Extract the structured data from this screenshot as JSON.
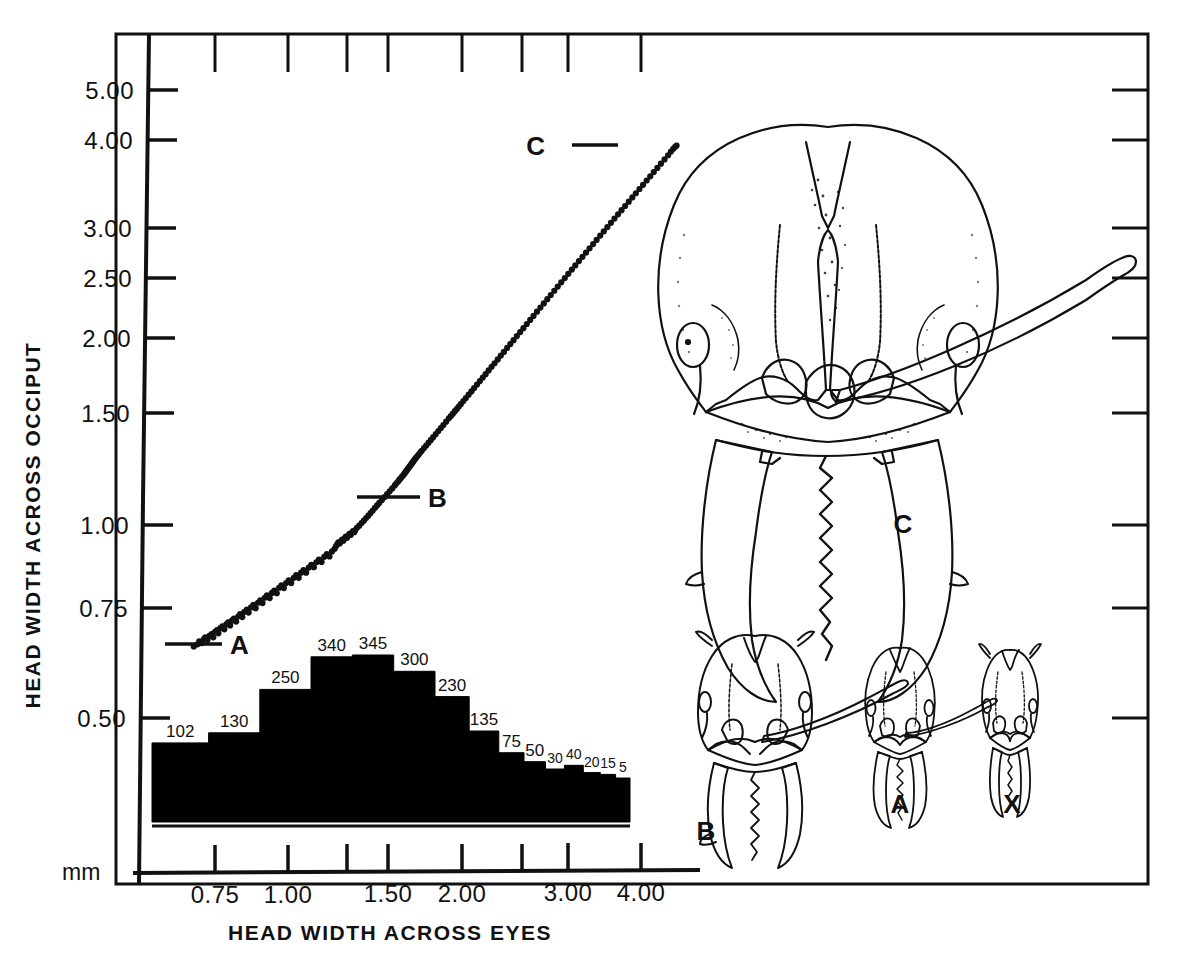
{
  "figure": {
    "title": "",
    "background_color": "#ffffff",
    "ink_color": "#000000"
  },
  "axes": {
    "y_label": "HEAD WIDTH ACROSS OCCIPUT",
    "x_label": "HEAD WIDTH ACROSS EYES",
    "unit_label": "mm",
    "y_ticks": [
      "5.00",
      "4.00",
      "3.00",
      "2.50",
      "2.00",
      "1.50",
      "1.00",
      "0.75",
      "0.50"
    ],
    "x_ticks": [
      "0.75",
      "1.00",
      "1.50",
      "2.00",
      "3.00",
      "4.00"
    ]
  },
  "chart_data": {
    "type": "scatter",
    "title": "",
    "xlabel": "HEAD WIDTH ACROSS EYES",
    "ylabel": "HEAD WIDTH ACROSS OCCIPUT",
    "units": "mm",
    "x_scale": "log",
    "y_scale": "log",
    "xlim": [
      0.6,
      4.6
    ],
    "ylim": [
      0.42,
      5.6
    ],
    "grid": false,
    "legend": "none",
    "x_tick_values": [
      0.75,
      1.0,
      1.25,
      1.5,
      2.0,
      2.5,
      3.0,
      4.0
    ],
    "x_tick_labels": [
      "0.75",
      "1.00",
      "",
      "1.50",
      "2.00",
      "",
      "3.00",
      "4.00"
    ],
    "y_tick_values": [
      5.0,
      4.0,
      3.0,
      2.5,
      2.0,
      1.5,
      1.0,
      0.75,
      0.5
    ],
    "y_tick_labels": [
      "5.00",
      "4.00",
      "3.00",
      "2.50",
      "2.00",
      "1.50",
      "1.00",
      "0.75",
      "0.50"
    ],
    "annotations": [
      {
        "label": "A",
        "x": 0.8,
        "y": 0.68,
        "note": "smallest minor worker caste"
      },
      {
        "label": "B",
        "x": 1.42,
        "y": 1.1,
        "note": "media worker caste"
      },
      {
        "label": "C",
        "x": 3.55,
        "y": 4.05,
        "note": "largest major worker caste"
      }
    ],
    "series": [
      {
        "name": "workers",
        "marker": "filled-circle",
        "points": [
          [
            0.69,
            0.65
          ],
          [
            0.7,
            0.655
          ],
          [
            0.705,
            0.662
          ],
          [
            0.712,
            0.658
          ],
          [
            0.718,
            0.668
          ],
          [
            0.722,
            0.672
          ],
          [
            0.728,
            0.666
          ],
          [
            0.734,
            0.676
          ],
          [
            0.74,
            0.68
          ],
          [
            0.745,
            0.672
          ],
          [
            0.75,
            0.686
          ],
          [
            0.756,
            0.69
          ],
          [
            0.76,
            0.682
          ],
          [
            0.766,
            0.695
          ],
          [
            0.772,
            0.7
          ],
          [
            0.778,
            0.692
          ],
          [
            0.784,
            0.705
          ],
          [
            0.79,
            0.71
          ],
          [
            0.796,
            0.702
          ],
          [
            0.802,
            0.715
          ],
          [
            0.808,
            0.72
          ],
          [
            0.815,
            0.712
          ],
          [
            0.822,
            0.726
          ],
          [
            0.828,
            0.732
          ],
          [
            0.835,
            0.724
          ],
          [
            0.842,
            0.738
          ],
          [
            0.85,
            0.744
          ],
          [
            0.856,
            0.736
          ],
          [
            0.864,
            0.75
          ],
          [
            0.872,
            0.757
          ],
          [
            0.88,
            0.748
          ],
          [
            0.888,
            0.763
          ],
          [
            0.896,
            0.77
          ],
          [
            0.904,
            0.762
          ],
          [
            0.912,
            0.777
          ],
          [
            0.92,
            0.784
          ],
          [
            0.93,
            0.776
          ],
          [
            0.938,
            0.791
          ],
          [
            0.947,
            0.798
          ],
          [
            0.956,
            0.79
          ],
          [
            0.965,
            0.806
          ],
          [
            0.974,
            0.813
          ],
          [
            0.983,
            0.805
          ],
          [
            0.992,
            0.82
          ],
          [
            1.002,
            0.828
          ],
          [
            1.012,
            0.82
          ],
          [
            1.022,
            0.836
          ],
          [
            1.032,
            0.844
          ],
          [
            1.042,
            0.836
          ],
          [
            1.052,
            0.852
          ],
          [
            1.062,
            0.86
          ],
          [
            1.073,
            0.852
          ],
          [
            1.084,
            0.868
          ],
          [
            1.095,
            0.877
          ],
          [
            1.106,
            0.869
          ],
          [
            1.117,
            0.885
          ],
          [
            1.128,
            0.894
          ],
          [
            1.14,
            0.886
          ],
          [
            1.152,
            0.903
          ],
          [
            1.164,
            0.912
          ],
          [
            1.176,
            0.904
          ],
          [
            1.188,
            0.921
          ],
          [
            1.2,
            0.93
          ],
          [
            1.206,
            0.938
          ],
          [
            1.212,
            0.945
          ],
          [
            1.218,
            0.952
          ],
          [
            1.224,
            0.948
          ],
          [
            1.23,
            0.956
          ],
          [
            1.236,
            0.962
          ],
          [
            1.242,
            0.958
          ],
          [
            1.248,
            0.966
          ],
          [
            1.254,
            0.972
          ],
          [
            1.26,
            0.968
          ],
          [
            1.266,
            0.975
          ],
          [
            1.272,
            0.982
          ],
          [
            1.278,
            0.978
          ],
          [
            1.284,
            0.986
          ],
          [
            1.29,
            0.992
          ],
          [
            1.296,
            0.988
          ],
          [
            1.302,
            0.996
          ],
          [
            1.31,
            1.004
          ],
          [
            1.322,
            1.012
          ],
          [
            1.334,
            1.022
          ],
          [
            1.346,
            1.031
          ],
          [
            1.358,
            1.041
          ],
          [
            1.37,
            1.05
          ],
          [
            1.382,
            1.06
          ],
          [
            1.394,
            1.07
          ],
          [
            1.406,
            1.08
          ],
          [
            1.418,
            1.09
          ],
          [
            1.43,
            1.1
          ],
          [
            1.445,
            1.112
          ],
          [
            1.46,
            1.124
          ],
          [
            1.475,
            1.136
          ],
          [
            1.49,
            1.148
          ],
          [
            1.505,
            1.16
          ],
          [
            1.52,
            1.173
          ],
          [
            1.53,
            1.182
          ],
          [
            1.54,
            1.19
          ],
          [
            1.548,
            1.198
          ],
          [
            1.556,
            1.204
          ],
          [
            1.564,
            1.212
          ],
          [
            1.572,
            1.218
          ],
          [
            1.58,
            1.226
          ],
          [
            1.586,
            1.232
          ],
          [
            1.592,
            1.238
          ],
          [
            1.598,
            1.244
          ],
          [
            1.604,
            1.25
          ],
          [
            1.61,
            1.256
          ],
          [
            1.616,
            1.262
          ],
          [
            1.622,
            1.268
          ],
          [
            1.628,
            1.274
          ],
          [
            1.634,
            1.28
          ],
          [
            1.64,
            1.286
          ],
          [
            1.646,
            1.292
          ],
          [
            1.652,
            1.298
          ],
          [
            1.66,
            1.305
          ],
          [
            1.67,
            1.314
          ],
          [
            1.68,
            1.323
          ],
          [
            1.69,
            1.332
          ],
          [
            1.705,
            1.345
          ],
          [
            1.72,
            1.358
          ],
          [
            1.736,
            1.372
          ],
          [
            1.752,
            1.386
          ],
          [
            1.768,
            1.4
          ],
          [
            1.786,
            1.416
          ],
          [
            1.804,
            1.432
          ],
          [
            1.822,
            1.448
          ],
          [
            1.84,
            1.464
          ],
          [
            1.86,
            1.482
          ],
          [
            1.88,
            1.5
          ],
          [
            1.895,
            1.513
          ],
          [
            1.91,
            1.526
          ],
          [
            1.925,
            1.54
          ],
          [
            1.94,
            1.553
          ],
          [
            1.955,
            1.566
          ],
          [
            1.97,
            1.58
          ],
          [
            1.99,
            1.598
          ],
          [
            2.01,
            1.616
          ],
          [
            2.032,
            1.636
          ],
          [
            2.054,
            1.656
          ],
          [
            2.076,
            1.676
          ],
          [
            2.1,
            1.698
          ],
          [
            2.124,
            1.72
          ],
          [
            2.148,
            1.742
          ],
          [
            2.172,
            1.764
          ],
          [
            2.198,
            1.788
          ],
          [
            2.224,
            1.812
          ],
          [
            2.25,
            1.836
          ],
          [
            2.278,
            1.862
          ],
          [
            2.306,
            1.888
          ],
          [
            2.334,
            1.914
          ],
          [
            2.364,
            1.942
          ],
          [
            2.394,
            1.97
          ],
          [
            2.424,
            1.998
          ],
          [
            2.456,
            2.028
          ],
          [
            2.488,
            2.058
          ],
          [
            2.52,
            2.088
          ],
          [
            2.554,
            2.12
          ],
          [
            2.588,
            2.152
          ],
          [
            2.622,
            2.184
          ],
          [
            2.658,
            2.218
          ],
          [
            2.694,
            2.252
          ],
          [
            2.73,
            2.286
          ],
          [
            2.768,
            2.322
          ],
          [
            2.806,
            2.358
          ],
          [
            2.845,
            2.395
          ],
          [
            2.884,
            2.432
          ],
          [
            2.924,
            2.47
          ],
          [
            2.965,
            2.509
          ],
          [
            3.006,
            2.548
          ],
          [
            3.048,
            2.588
          ],
          [
            3.09,
            2.628
          ],
          [
            3.134,
            2.67
          ],
          [
            3.178,
            2.712
          ],
          [
            3.222,
            2.754
          ],
          [
            3.268,
            2.798
          ],
          [
            3.314,
            2.842
          ],
          [
            3.36,
            2.886
          ],
          [
            3.408,
            2.932
          ],
          [
            3.456,
            2.978
          ],
          [
            3.505,
            3.025
          ],
          [
            3.554,
            3.072
          ],
          [
            3.604,
            3.12
          ],
          [
            3.655,
            3.169
          ],
          [
            3.706,
            3.218
          ],
          [
            3.758,
            3.268
          ],
          [
            3.812,
            3.32
          ],
          [
            3.866,
            3.372
          ],
          [
            3.92,
            3.424
          ],
          [
            3.976,
            3.478
          ],
          [
            4.032,
            3.532
          ],
          [
            4.09,
            3.588
          ],
          [
            4.148,
            3.644
          ],
          [
            4.206,
            3.7
          ],
          [
            4.266,
            3.758
          ],
          [
            4.326,
            3.816
          ],
          [
            4.388,
            3.876
          ],
          [
            4.45,
            3.936
          ],
          [
            4.5,
            3.99
          ],
          [
            4.54,
            4.03
          ],
          [
            4.575,
            4.06
          ],
          [
            4.6,
            4.078
          ]
        ]
      }
    ]
  },
  "histogram": {
    "type": "bar",
    "title": "",
    "orientation": "vertical",
    "note": "frequency distribution of head width across eyes",
    "bin_counts": [
      102,
      130,
      250,
      340,
      345,
      300,
      230,
      135,
      75,
      50,
      30,
      40,
      20,
      15,
      5
    ],
    "bin_labels": [
      "102",
      "130",
      "250",
      "340",
      "345",
      "300",
      "230",
      "135",
      "75",
      "50",
      "30",
      "40",
      "20",
      "15",
      "5"
    ],
    "bar_color": "#000000",
    "ylabel": "",
    "xlabel": ""
  },
  "drawings": [
    {
      "id": "C",
      "label": "C",
      "caption": "major worker head, full face view",
      "size": "largest"
    },
    {
      "id": "B",
      "label": "B",
      "caption": "media worker head, full face view",
      "size": "large"
    },
    {
      "id": "A",
      "label": "A",
      "caption": "minor worker head, full face view",
      "size": "small"
    },
    {
      "id": "X",
      "label": "X",
      "caption": "smallest worker head, full face view",
      "size": "smallest"
    }
  ],
  "callouts": {
    "a": "A",
    "b": "B",
    "c": "C"
  }
}
